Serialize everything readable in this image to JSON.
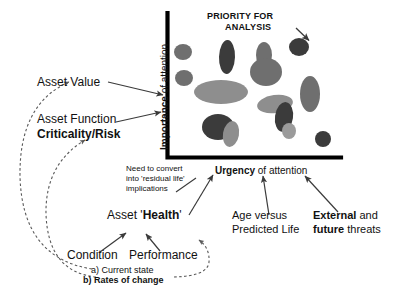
{
  "diagram": {
    "title_annotation": {
      "line1": "PRIORITY FOR",
      "line2": "ANALYSIS"
    },
    "axes": {
      "y_label_bold": "Importance",
      "y_label_rest": " of attention",
      "x_label_bold": "Urgency",
      "x_label_rest": " of attention"
    },
    "left_labels": {
      "asset_value": "Asset Value",
      "asset_function": "Asset Function",
      "criticality_risk": "Criticality/Risk"
    },
    "notes": {
      "convert_line1": "Need to convert",
      "convert_line2": "into 'residual life'",
      "convert_line3": "implications"
    },
    "bottom_labels": {
      "asset_health_prefix": "Asset '",
      "asset_health_bold": "Health",
      "asset_health_suffix": "'",
      "age_line1": "Age versus",
      "age_line2": "Predicted Life",
      "threats_bold1": "External",
      "threats_mid": " and",
      "threats_bold2": "future",
      "threats_tail": " threats",
      "condition": "Condition",
      "performance": "Performance",
      "state_a": "a) Current state",
      "state_b": "b) Rates of change"
    },
    "colors": {
      "axis": "#000000",
      "arrow": "#3a3a3a",
      "dashed": "#6a6a6a",
      "text": "#111111",
      "blob_dark": "#3b3b3b",
      "blob_mid": "#6f6f6f",
      "blob_light": "#8e8e8e",
      "blob_lighter": "#9b9b9b"
    }
  },
  "chart_data": {
    "type": "scatter",
    "title": "PRIORITY FOR ANALYSIS",
    "xlabel": "Urgency of attention",
    "ylabel": "Importance of attention",
    "grid": false,
    "legend": null,
    "xlim": [
      0,
      100
    ],
    "ylim": [
      0,
      100
    ],
    "annotations": [
      {
        "text": "PRIORITY FOR ANALYSIS",
        "points_to": "top-right high-importance high-urgency cluster"
      }
    ],
    "blobs": [
      {
        "id": 1,
        "cx": 183,
        "cy": 52,
        "rx": 9,
        "ry": 8,
        "rot": 0,
        "shade": "blob_mid"
      },
      {
        "id": 2,
        "cx": 184,
        "cy": 78,
        "rx": 9,
        "ry": 8,
        "rot": 0,
        "shade": "blob_mid"
      },
      {
        "id": 3,
        "cx": 227,
        "cy": 57,
        "rx": 8,
        "ry": 17,
        "rot": 2,
        "shade": "blob_dark"
      },
      {
        "id": 4,
        "cx": 221,
        "cy": 92,
        "rx": 27,
        "ry": 12,
        "rot": 0,
        "shade": "blob_light"
      },
      {
        "id": 5,
        "cx": 264,
        "cy": 55,
        "rx": 8,
        "ry": 13,
        "rot": 0,
        "shade": "blob_mid"
      },
      {
        "id": 6,
        "cx": 266,
        "cy": 72,
        "rx": 16,
        "ry": 14,
        "rot": 0,
        "shade": "blob_mid"
      },
      {
        "id": 7,
        "cx": 299,
        "cy": 47,
        "rx": 10,
        "ry": 9,
        "rot": 0,
        "shade": "blob_dark"
      },
      {
        "id": 8,
        "cx": 310,
        "cy": 94,
        "rx": 10,
        "ry": 18,
        "rot": 0,
        "shade": "blob_mid"
      },
      {
        "id": 9,
        "cx": 275,
        "cy": 104,
        "rx": 18,
        "ry": 9,
        "rot": -8,
        "shade": "blob_light"
      },
      {
        "id": 10,
        "cx": 284,
        "cy": 117,
        "rx": 9,
        "ry": 15,
        "rot": 8,
        "shade": "blob_dark"
      },
      {
        "id": 11,
        "cx": 289,
        "cy": 131,
        "rx": 7,
        "ry": 8,
        "rot": 0,
        "shade": "blob_lighter"
      },
      {
        "id": 12,
        "cx": 218,
        "cy": 127,
        "rx": 16,
        "ry": 13,
        "rot": 0,
        "shade": "blob_dark"
      },
      {
        "id": 13,
        "cx": 231,
        "cy": 134,
        "rx": 8,
        "ry": 13,
        "rot": 10,
        "shade": "blob_light"
      },
      {
        "id": 14,
        "cx": 323,
        "cy": 139,
        "rx": 8,
        "ry": 8,
        "rot": 0,
        "shade": "blob_dark"
      }
    ]
  }
}
